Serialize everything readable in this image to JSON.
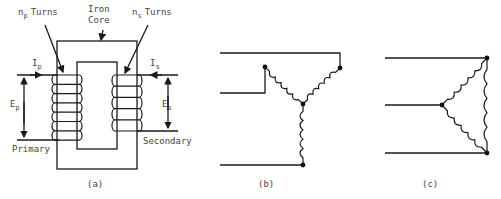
{
  "figure": {
    "panel_a": {
      "caption": "(a)",
      "labels": {
        "np_turns": {
          "symbol": "n",
          "subscript": "p",
          "text": "Turns"
        },
        "ns_turns": {
          "symbol": "n",
          "subscript": "s",
          "text": "Turns"
        },
        "iron_core_line1": "Iron",
        "iron_core_line2": "Core",
        "ip": {
          "symbol": "I",
          "subscript": "p"
        },
        "is": {
          "symbol": "I",
          "subscript": "s"
        },
        "ep": {
          "symbol": "E",
          "subscript": "p"
        },
        "es": {
          "symbol": "E",
          "subscript": "s"
        },
        "primary": "Primary",
        "secondary": "Secondary"
      },
      "primary_turns_drawn": 7,
      "secondary_turns_drawn": 5
    },
    "panel_b": {
      "caption": "(b)",
      "connection": "wye"
    },
    "panel_c": {
      "caption": "(c)",
      "connection": "delta"
    }
  }
}
